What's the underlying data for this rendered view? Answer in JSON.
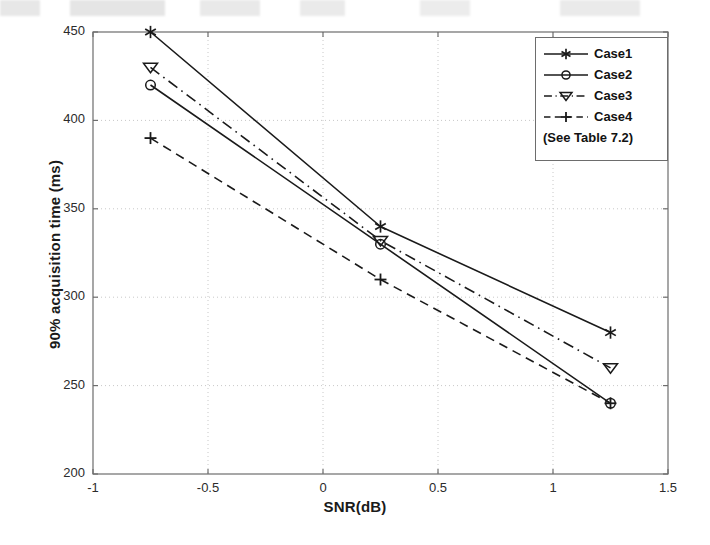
{
  "chart_data": {
    "type": "line",
    "title": "",
    "xlabel": "SNR(dB)",
    "ylabel": "90% acquisition time (ms)",
    "xlim": [
      -1,
      1.5
    ],
    "ylim": [
      200,
      450
    ],
    "xticks": [
      "-1",
      "-0.5",
      "0",
      "0.5",
      "1",
      "1.5"
    ],
    "xtick_values": [
      -1,
      -0.5,
      0,
      0.5,
      1,
      1.5
    ],
    "yticks": [
      "200",
      "250",
      "300",
      "350",
      "400",
      "450"
    ],
    "ytick_values": [
      200,
      250,
      300,
      350,
      400,
      450
    ],
    "grid": true,
    "grid_style": "dotted",
    "legend_position": "top-right",
    "legend_note": "(See Table 7.2)",
    "x": [
      -0.75,
      0.25,
      1.25
    ],
    "series": [
      {
        "name": "Case1",
        "values": [
          450,
          340,
          280
        ],
        "line_style": "solid",
        "marker": "star",
        "color": "#1a1a1a"
      },
      {
        "name": "Case2",
        "values": [
          420,
          330,
          240
        ],
        "line_style": "solid",
        "marker": "circle",
        "color": "#1a1a1a"
      },
      {
        "name": "Case3",
        "values": [
          430,
          332,
          260
        ],
        "line_style": "dashdot",
        "marker": "triangle-down",
        "color": "#1a1a1a"
      },
      {
        "name": "Case4",
        "values": [
          390,
          310,
          240
        ],
        "line_style": "dashed",
        "marker": "plus",
        "color": "#1a1a1a"
      }
    ]
  },
  "plot_geometry": {
    "left": 93,
    "right": 668,
    "top": 32,
    "bottom": 474
  },
  "legend_geometry": {
    "left": 535,
    "top": 37,
    "width": 133,
    "height": 124
  },
  "style": {
    "axis_color": "#6d6d6d",
    "grid_color": "#c8c8c8",
    "text_color": "#1a1a1a",
    "background": "#ffffff"
  }
}
